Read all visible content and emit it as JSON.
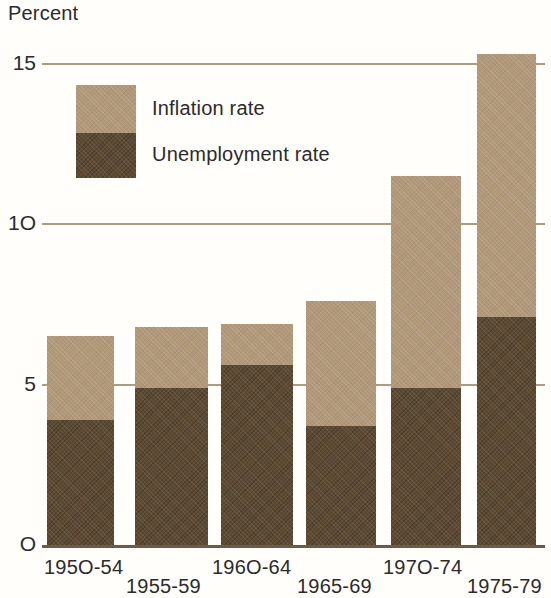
{
  "chart_data": {
    "type": "bar",
    "title": "",
    "subtitle": "",
    "xlabel": "",
    "ylabel": "Percent",
    "stacked": true,
    "grid": true,
    "legend_position": "inside-top-left",
    "categories": [
      "1950-54",
      "1955-59",
      "1960-64",
      "1965-69",
      "1970-74",
      "1975-79"
    ],
    "ylim": [
      0,
      15.6
    ],
    "yticks": [
      0,
      5,
      10,
      15
    ],
    "ytick_labels": [
      "O",
      "5",
      "1O",
      "15"
    ],
    "series": [
      {
        "name": "Unemployment rate",
        "color": "#5c4a32",
        "values": [
          3.9,
          4.9,
          5.6,
          3.7,
          4.9,
          7.1
        ]
      },
      {
        "name": "Inflation rate",
        "color": "#b09878",
        "values": [
          2.6,
          1.9,
          1.3,
          3.9,
          6.6,
          8.2
        ]
      }
    ],
    "totals": [
      6.5,
      6.8,
      6.9,
      7.6,
      11.5,
      15.3
    ],
    "annotations": []
  },
  "axis": {
    "y_title": "Percent",
    "gridline_color": "#b49a7c",
    "baseline_color": "#6e5b43"
  },
  "legend": {
    "items": [
      {
        "label": "Inflation rate",
        "color": "#b09878"
      },
      {
        "label": "Unemployment rate",
        "color": "#5c4a32"
      }
    ]
  }
}
